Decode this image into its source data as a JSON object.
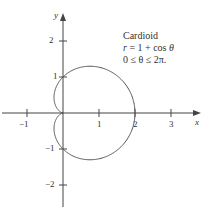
{
  "chart_data": {
    "type": "line",
    "title": "Cardioid",
    "equation": "r = 1 + cos θ",
    "domain": "0 ≤ θ ≤ 2π.",
    "xlabel": "x",
    "ylabel": "y",
    "xlim": [
      -1.7,
      3.6
    ],
    "ylim": [
      -2.6,
      3.0
    ],
    "x_ticks": [
      -1,
      1,
      2,
      3
    ],
    "x_tick_labels": [
      "−1",
      "1",
      "2",
      "3"
    ],
    "y_ticks": [
      2,
      1,
      -1,
      -2
    ],
    "y_tick_labels": [
      "2",
      "1",
      "−1",
      "−2"
    ],
    "grid": false,
    "series": [
      {
        "name": "Cardioid",
        "polar": "r = 1 + cos(theta)",
        "theta_range": [
          0,
          6.2832
        ],
        "color": "#555555"
      }
    ]
  },
  "annotation": {
    "line1": "Cardioid",
    "line2_var": "r",
    "line2_rest": " = 1 + cos ",
    "line2_theta": "θ",
    "line3": "0 ≤ θ ≤ 2π."
  },
  "colors": {
    "axis": "#444444",
    "curve": "#555555",
    "text": "#333333"
  }
}
